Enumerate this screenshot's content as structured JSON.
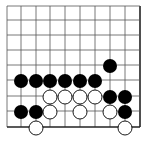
{
  "board": {
    "grid": {
      "x_lines": [
        7,
        21,
        36,
        50,
        65,
        80,
        95,
        110,
        125,
        140
      ],
      "y_lines": [
        6,
        20,
        35,
        50,
        65,
        80,
        96,
        111,
        127
      ],
      "right_edge_x": 140,
      "bottom_edge_y": 127,
      "line_color": "#555555",
      "edge_color": "#222222"
    },
    "stone_radius": 7,
    "stones": [
      {
        "color": "black",
        "x": 110,
        "y": 66
      },
      {
        "color": "black",
        "x": 21,
        "y": 81
      },
      {
        "color": "black",
        "x": 36,
        "y": 81
      },
      {
        "color": "black",
        "x": 50,
        "y": 81
      },
      {
        "color": "black",
        "x": 65,
        "y": 81
      },
      {
        "color": "black",
        "x": 80,
        "y": 81
      },
      {
        "color": "black",
        "x": 95,
        "y": 81
      },
      {
        "color": "white",
        "x": 50,
        "y": 97
      },
      {
        "color": "white",
        "x": 65,
        "y": 97
      },
      {
        "color": "white",
        "x": 80,
        "y": 97
      },
      {
        "color": "white",
        "x": 95,
        "y": 97
      },
      {
        "color": "black",
        "x": 110,
        "y": 97
      },
      {
        "color": "black",
        "x": 125,
        "y": 97
      },
      {
        "color": "black",
        "x": 21,
        "y": 112
      },
      {
        "color": "black",
        "x": 36,
        "y": 112
      },
      {
        "color": "white",
        "x": 50,
        "y": 112
      },
      {
        "color": "white",
        "x": 80,
        "y": 112
      },
      {
        "color": "white",
        "x": 110,
        "y": 112
      },
      {
        "color": "black",
        "x": 125,
        "y": 112
      },
      {
        "color": "white",
        "x": 36,
        "y": 128
      },
      {
        "color": "white",
        "x": 125,
        "y": 128
      }
    ]
  }
}
